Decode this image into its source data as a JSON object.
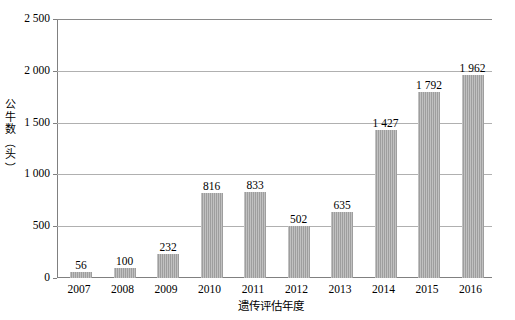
{
  "chart_data": {
    "type": "bar",
    "title": "",
    "xlabel": "遗传评估年度",
    "ylabel": "公牛数（头）",
    "categories": [
      "2007",
      "2008",
      "2009",
      "2010",
      "2011",
      "2012",
      "2013",
      "2014",
      "2015",
      "2016"
    ],
    "values": [
      56,
      100,
      232,
      816,
      833,
      502,
      635,
      1427,
      1792,
      1962
    ],
    "value_labels": [
      "56",
      "100",
      "232",
      "816",
      "833",
      "502",
      "635",
      "1 427",
      "1 792",
      "1 962"
    ],
    "ylim": [
      0,
      2500
    ],
    "ytick_values": [
      0,
      500,
      1000,
      1500,
      2000,
      2500
    ],
    "ytick_labels": [
      "0",
      "500",
      "1 000",
      "1 500",
      "2 000",
      "2 500"
    ],
    "grid": "horizontal",
    "legend": "none",
    "bar_color": "#a6a6a6",
    "gridline_color": "#b0b0b0",
    "axis_color": "#808080"
  },
  "axis": {
    "y_title_chars": [
      "公",
      "牛",
      "数"
    ],
    "y_title_open_paren": "（",
    "y_title_unit": "头",
    "y_title_close_paren": "）",
    "x_title": "遗传评估年度"
  }
}
